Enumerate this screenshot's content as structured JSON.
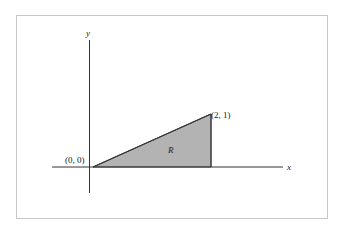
{
  "diagram": {
    "axes": {
      "x_label": "x",
      "y_label": "y"
    },
    "points": [
      {
        "label": "(0, 0)",
        "x": 0,
        "y": 0
      },
      {
        "label": "(2, 1)",
        "x": 2,
        "y": 1
      }
    ],
    "region": {
      "label": "R",
      "vertices": [
        [
          0,
          0
        ],
        [
          2,
          1
        ],
        [
          2,
          0
        ]
      ],
      "fill": "#b3b3b3"
    },
    "colors": {
      "frame": "#c8c8c8",
      "lines": "#333333"
    }
  }
}
